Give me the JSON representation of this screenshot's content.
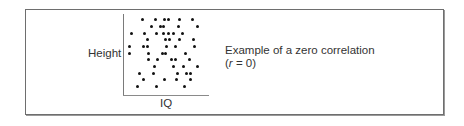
{
  "figure": {
    "caption_line1": "Example of a zero correlation",
    "caption_line2_prefix": "(",
    "caption_r": "r",
    "caption_line2_suffix": " = 0)",
    "ylabel": "Height",
    "xlabel": "IQ"
  },
  "chart_data": {
    "type": "scatter",
    "title": "Example of a zero correlation (r = 0)",
    "xlabel": "IQ",
    "ylabel": "Height",
    "grid": false,
    "ticks": false,
    "correlation_r": 0,
    "points_px": [
      [
        142,
        19
      ],
      [
        155,
        19
      ],
      [
        164,
        19
      ],
      [
        168,
        19
      ],
      [
        179,
        19
      ],
      [
        192,
        19
      ],
      [
        151,
        26
      ],
      [
        160,
        26
      ],
      [
        163,
        26
      ],
      [
        178,
        26
      ],
      [
        197,
        26
      ],
      [
        131,
        33
      ],
      [
        144,
        33
      ],
      [
        156,
        33
      ],
      [
        163,
        33
      ],
      [
        168,
        33
      ],
      [
        173,
        33
      ],
      [
        182,
        33
      ],
      [
        147,
        39
      ],
      [
        165,
        39
      ],
      [
        169,
        39
      ],
      [
        179,
        39
      ],
      [
        193,
        39
      ],
      [
        129,
        46
      ],
      [
        143,
        46
      ],
      [
        147,
        46
      ],
      [
        166,
        46
      ],
      [
        175,
        46
      ],
      [
        194,
        46
      ],
      [
        129,
        53
      ],
      [
        148,
        53
      ],
      [
        162,
        53
      ],
      [
        165,
        53
      ],
      [
        185,
        53
      ],
      [
        148,
        59
      ],
      [
        157,
        59
      ],
      [
        171,
        59
      ],
      [
        175,
        59
      ],
      [
        189,
        59
      ],
      [
        154,
        66
      ],
      [
        173,
        66
      ],
      [
        183,
        66
      ],
      [
        197,
        66
      ],
      [
        139,
        73
      ],
      [
        153,
        73
      ],
      [
        177,
        73
      ],
      [
        186,
        73
      ],
      [
        190,
        73
      ],
      [
        143,
        79
      ],
      [
        164,
        79
      ],
      [
        176,
        79
      ],
      [
        190,
        79
      ],
      [
        137,
        86
      ],
      [
        156,
        86
      ],
      [
        184,
        86
      ]
    ]
  }
}
